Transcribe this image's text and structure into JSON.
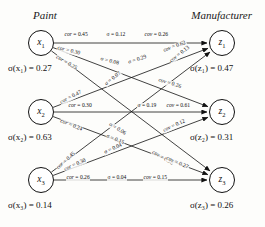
{
  "headers": {
    "left": "Paint",
    "right": "Manufacturer"
  },
  "left_nodes": [
    {
      "id": "x1",
      "label": "x",
      "sub": "1",
      "sigma_label": "σ(x₁) = 0.27",
      "sigma": 0.27
    },
    {
      "id": "x2",
      "label": "x",
      "sub": "2",
      "sigma_label": "σ(x₂) = 0.63",
      "sigma": 0.63
    },
    {
      "id": "x3",
      "label": "x",
      "sub": "3",
      "sigma_label": "σ(x₃) = 0.14",
      "sigma": 0.14
    }
  ],
  "right_nodes": [
    {
      "id": "z1",
      "label": "z",
      "sub": "1",
      "sigma_label": "σ(z₁) = 0.47",
      "sigma": 0.47
    },
    {
      "id": "z2",
      "label": "z",
      "sub": "2",
      "sigma_label": "σ(z₂) = 0.31",
      "sigma": 0.31
    },
    {
      "id": "z3",
      "label": "z",
      "sub": "3",
      "sigma_label": "σ(z₃) = 0.26",
      "sigma": 0.26
    }
  ],
  "edges": [
    {
      "from": "x1",
      "to": "z1",
      "cor_label": "cor = 0.45",
      "sigma_label": "σ = 0.12",
      "cov_label": "cov = 0.26",
      "cor": 0.45,
      "sigma": 0.12,
      "cov": 0.26
    },
    {
      "from": "x1",
      "to": "z2",
      "cor_label": "cor = 0.30",
      "sigma_label": "σ = 0.08",
      "cov_label": "cov = 0.26",
      "cor": 0.3,
      "sigma": 0.08,
      "cov": 0.26
    },
    {
      "from": "x1",
      "to": "z3",
      "cor_label": "cor = 0.25",
      "sigma_label": "σ = 0.06",
      "cov_label": "cov = 0.58",
      "cor": 0.25,
      "sigma": 0.06,
      "cov": 0.58
    },
    {
      "from": "x2",
      "to": "z1",
      "cor_label": "cor = 0.47",
      "sigma_label": "σ = 0.29",
      "cov_label": "cov = 0.62",
      "cor": 0.47,
      "sigma": 0.29,
      "cov": 0.62
    },
    {
      "from": "x2",
      "to": "z2",
      "cor_label": "cor = 0.30",
      "sigma_label": "σ = 0.19",
      "cov_label": "cov = 0.61",
      "cor": 0.3,
      "sigma": 0.19,
      "cov": 0.61
    },
    {
      "from": "x2",
      "to": "z3",
      "cor_label": "cor = 0.24",
      "sigma_label": "σ = 0.15",
      "cov_label": "cov = 0.27",
      "cor": 0.24,
      "sigma": 0.15,
      "cov": 0.27
    },
    {
      "from": "x3",
      "to": "z1",
      "cor_label": "cor = 0.45",
      "sigma_label": "σ = 0.07",
      "cov_label": "cov = 0.13",
      "cor": 0.45,
      "sigma": 0.07,
      "cov": 0.13
    },
    {
      "from": "x3",
      "to": "z2",
      "cor_label": "cor = 0.30",
      "sigma_label": "σ = 0.04",
      "cov_label": "cov = 0.12",
      "cor": 0.3,
      "sigma": 0.04,
      "cov": 0.12
    },
    {
      "from": "x3",
      "to": "z3",
      "cor_label": "cor = 0.26",
      "sigma_label": "σ = 0.04",
      "cov_label": "cov = 0.15",
      "cor": 0.26,
      "sigma": 0.04,
      "cov": 0.15
    }
  ],
  "edge_labels_placed": [
    {
      "name": "x1-z1-cor",
      "text": "cor = 0.45",
      "x": 64,
      "y": 35,
      "rot": 0
    },
    {
      "name": "x1-z1-sigma",
      "text": "σ = 0.12",
      "x": 106,
      "y": 35,
      "rot": 0
    },
    {
      "name": "x1-z1-cov",
      "text": "cov = 0.26",
      "x": 144,
      "y": 35,
      "rot": 0
    },
    {
      "name": "x1-z2-cor",
      "text": "cor = 0.30",
      "x": 57,
      "y": 48,
      "rot": 14
    },
    {
      "name": "x1-z2-sigma",
      "text": "σ = 0.08",
      "x": 100,
      "y": 59,
      "rot": 14
    },
    {
      "name": "x1-z2-cov",
      "text": "cov = 0.26",
      "x": 158,
      "y": 80,
      "rot": 17
    },
    {
      "name": "x1-z3-cor",
      "text": "cor = 0.25",
      "x": 56,
      "y": 57,
      "rot": 30
    },
    {
      "name": "x1-z3-sigma",
      "text": "σ = 0.06",
      "x": 109,
      "y": 124,
      "rot": 32
    },
    {
      "name": "x1-z3-cov",
      "text": "cov = 0.58",
      "x": 152,
      "y": 152,
      "rot": 30
    },
    {
      "name": "x2-z1-cor",
      "text": "cor = 0.47",
      "x": 60,
      "y": 103,
      "rot": -27
    },
    {
      "name": "x2-z1-sigma",
      "text": "σ = 0.29",
      "x": 128,
      "y": 63,
      "rot": -18
    },
    {
      "name": "x2-z1-cov",
      "text": "cov = 0.62",
      "x": 163,
      "y": 51,
      "rot": -20
    },
    {
      "name": "x2-z2-cor",
      "text": "cor = 0.30",
      "x": 68,
      "y": 106,
      "rot": 0
    },
    {
      "name": "x2-z2-sigma",
      "text": "σ = 0.19",
      "x": 137,
      "y": 106,
      "rot": 0
    },
    {
      "name": "x2-z2-cov",
      "text": "cov = 0.61",
      "x": 166,
      "y": 106,
      "rot": 0
    },
    {
      "name": "x2-z3-cor",
      "text": "cor = 0.24",
      "x": 60,
      "y": 121,
      "rot": 22
    },
    {
      "name": "x2-z3-sigma",
      "text": "σ = 0.15",
      "x": 106,
      "y": 136,
      "rot": 22
    },
    {
      "name": "x2-z3-cov",
      "text": "cov = 0.27",
      "x": 166,
      "y": 158,
      "rot": 24
    },
    {
      "name": "x3-z1-cor",
      "text": "cor = 0.45",
      "x": 57,
      "y": 169,
      "rot": -42
    },
    {
      "name": "x3-z1-sigma",
      "text": "σ = 0.07",
      "x": 105,
      "y": 85,
      "rot": -38
    },
    {
      "name": "x3-z1-cov",
      "text": "cov = 0.13",
      "x": 170,
      "y": 62,
      "rot": -38
    },
    {
      "name": "x3-z2-cor",
      "text": "cor = 0.30",
      "x": 64,
      "y": 170,
      "rot": -24
    },
    {
      "name": "x3-z2-sigma",
      "text": "σ = 0.04",
      "x": 104,
      "y": 153,
      "rot": -24
    },
    {
      "name": "x3-z2-cov",
      "text": "cov = 0.12",
      "x": 163,
      "y": 131,
      "rot": -24
    },
    {
      "name": "x3-z3-cor",
      "text": "cor = 0.26",
      "x": 66,
      "y": 178,
      "rot": 0
    },
    {
      "name": "x3-z3-sigma",
      "text": "σ = 0.04",
      "x": 107,
      "y": 178,
      "rot": 0
    },
    {
      "name": "x3-z3-cov",
      "text": "cov = 0.15",
      "x": 143,
      "y": 178,
      "rot": 0
    }
  ],
  "geometry": {
    "left_x": 41,
    "right_x": 222,
    "rows_y": [
      43,
      112,
      180
    ],
    "node_radius": 13
  },
  "colors": {
    "background": "#fdfdfb",
    "stroke": "#111111",
    "text": "#111111"
  }
}
